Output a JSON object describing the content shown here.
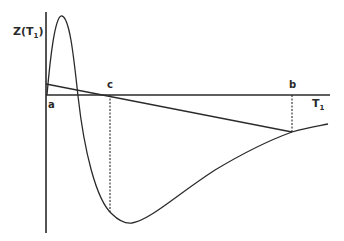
{
  "diagram": {
    "y_axis_label": "Z(T",
    "y_axis_label_sub": "1",
    "y_axis_label_close": ")",
    "x_axis_label": "T",
    "x_axis_label_sub": "1",
    "points": {
      "a": "a",
      "b": "b",
      "c": "c"
    },
    "stroke_color": "#2a2a2a"
  }
}
